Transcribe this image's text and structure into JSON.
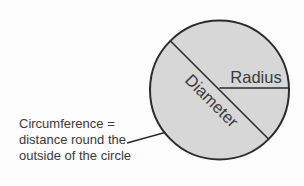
{
  "diagram": {
    "labels": {
      "radius": "Radius",
      "diameter": "Diameter",
      "circumference_line1": "Circumference =",
      "circumference_line2": "distance round the",
      "circumference_line3": "outside of the circle"
    },
    "colors": {
      "circle_fill": "#d7d7d7",
      "line_stroke": "#2b2b2b",
      "text": "#3a3a3a",
      "background": "#fdfdfd"
    }
  }
}
